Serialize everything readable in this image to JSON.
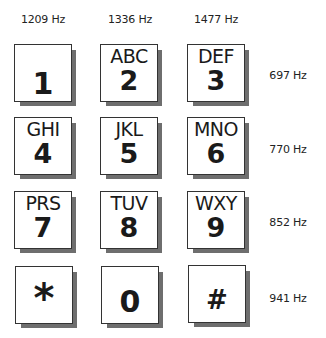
{
  "columns": [
    {
      "label": "1209 Hz"
    },
    {
      "label": "1336 Hz"
    },
    {
      "label": "1477 Hz"
    }
  ],
  "rows": [
    {
      "label": "697 Hz"
    },
    {
      "label": "770 Hz"
    },
    {
      "label": "852 Hz"
    },
    {
      "label": "941 Hz"
    }
  ],
  "keys": [
    {
      "digit": "1",
      "letters": ""
    },
    {
      "digit": "2",
      "letters": "ABC"
    },
    {
      "digit": "3",
      "letters": "DEF"
    },
    {
      "digit": "4",
      "letters": "GHI"
    },
    {
      "digit": "5",
      "letters": "JKL"
    },
    {
      "digit": "6",
      "letters": "MNO"
    },
    {
      "digit": "7",
      "letters": "PRS"
    },
    {
      "digit": "8",
      "letters": "TUV"
    },
    {
      "digit": "9",
      "letters": "WXY"
    },
    {
      "digit": "*",
      "letters": ""
    },
    {
      "digit": "0",
      "letters": ""
    },
    {
      "digit": "#",
      "letters": ""
    }
  ],
  "colors": {
    "key_face": "#ffffff",
    "key_border": "#333333",
    "key_shadow": "#6e6e6e",
    "text": "#1a1a1a"
  }
}
